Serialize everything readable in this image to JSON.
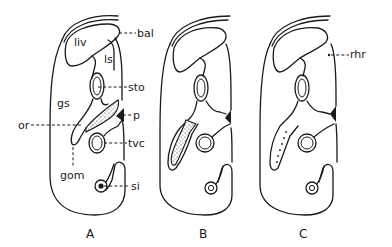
{
  "figure": {
    "panels": [
      {
        "id": "A",
        "label": "A"
      },
      {
        "id": "B",
        "label": "B"
      },
      {
        "id": "C",
        "label": "C"
      }
    ],
    "labels_panel_a": {
      "liv": "liv",
      "ls": "ls",
      "gs": "gs",
      "bal": "bal",
      "sto": "sto",
      "p": "p",
      "or": "or",
      "tvc": "tvc",
      "gom": "gom",
      "si": "si"
    },
    "labels_panel_c": {
      "rhr": "rhr"
    },
    "colors": {
      "line": "#1a1a1a",
      "background": "#ffffff"
    }
  }
}
